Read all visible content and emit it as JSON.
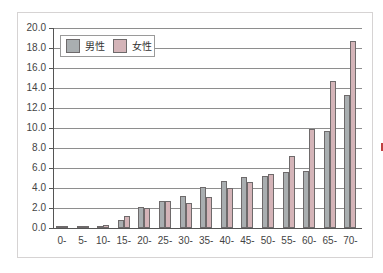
{
  "chart_data": {
    "type": "bar",
    "title": "",
    "xlabel": "",
    "ylabel": "",
    "ylim": [
      0,
      20
    ],
    "yticks": [
      "0.0",
      "2.0",
      "4.0",
      "6.0",
      "8.0",
      "10.0",
      "12.0",
      "14.0",
      "16.0",
      "18.0",
      "20.0"
    ],
    "grid": true,
    "legend_position": "upper-left",
    "categories": [
      "0-",
      "5-",
      "10-",
      "15-",
      "20-",
      "25-",
      "30-",
      "35-",
      "40-",
      "45-",
      "50-",
      "55-",
      "60-",
      "65-",
      "70-"
    ],
    "series": [
      {
        "name": "男性",
        "color": "#a9aeb0",
        "values": [
          0.05,
          0.1,
          0.2,
          0.8,
          2.1,
          2.7,
          3.2,
          4.1,
          4.7,
          5.1,
          5.2,
          5.6,
          5.7,
          9.7,
          13.3
        ]
      },
      {
        "name": "女性",
        "color": "#d4b4b8",
        "values": [
          0.05,
          0.1,
          0.3,
          1.2,
          2.0,
          2.7,
          2.5,
          3.1,
          4.0,
          4.6,
          5.4,
          7.2,
          9.9,
          14.7,
          18.7
        ]
      }
    ]
  },
  "legend": {
    "male_label": "男性",
    "female_label": "女性"
  }
}
